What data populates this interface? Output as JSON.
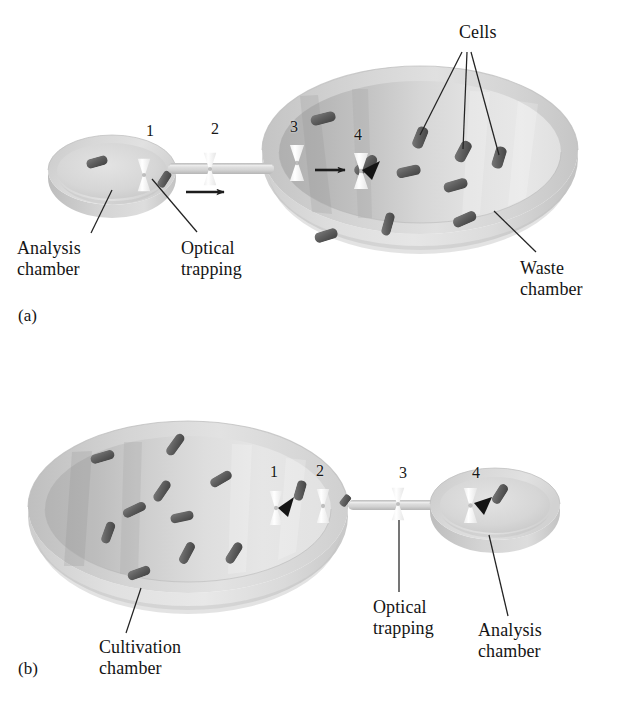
{
  "figure": {
    "background": "#ffffff",
    "ink": "#141414",
    "palette": {
      "bowl_rim_light": "#dcdcdc",
      "bowl_rim_mid": "#c8c8c8",
      "bowl_interior_dark": "#b6b6b6",
      "bowl_interior_light": "#e3e3e3",
      "dish_light": "#dadada",
      "dish_shadow": "#b9b9b9",
      "channel": "#cfcfcf",
      "cell": "#6a6a6a",
      "cell_dark": "#4c4c4c",
      "trap_white": "#fdfdfd",
      "leader": "#2a2a2a"
    }
  },
  "panels": [
    {
      "id": "a",
      "tag": "(a)",
      "tag_pos": {
        "x": 18,
        "y": 315
      },
      "description": "Cell transported by optical trapping from analysis chamber to waste chamber",
      "flow_direction": "left-to-right",
      "chambers": [
        {
          "name": "analysis-chamber",
          "role": "source",
          "size": "small",
          "label": "Analysis\nchamber"
        },
        {
          "name": "waste-chamber",
          "role": "destination",
          "size": "large",
          "label": "Waste\nchamber"
        }
      ],
      "trap_numbers": [
        {
          "n": "1",
          "x": 150,
          "y": 132
        },
        {
          "n": "2",
          "x": 215,
          "y": 130
        },
        {
          "n": "3",
          "x": 294,
          "y": 128
        },
        {
          "n": "4",
          "x": 358,
          "y": 136
        }
      ],
      "labels": [
        {
          "name": "analysis-chamber-label",
          "text": "Analysis\nchamber",
          "x": 17,
          "y": 246,
          "align": "left",
          "size": 18
        },
        {
          "name": "optical-trapping-label",
          "text": "Optical\ntrapping",
          "x": 181,
          "y": 246,
          "align": "left",
          "size": 18
        },
        {
          "name": "waste-chamber-label",
          "text": "Waste\nchamber",
          "x": 520,
          "y": 266,
          "align": "left",
          "size": 18
        },
        {
          "name": "cells-label",
          "text": "Cells",
          "x": 459,
          "y": 30,
          "align": "left",
          "size": 18
        }
      ]
    },
    {
      "id": "b",
      "tag": "(b)",
      "tag_pos": {
        "x": 18,
        "y": 668
      },
      "description": "Cell transported by optical trapping from cultivation chamber to analysis chamber",
      "flow_direction": "left-to-right",
      "chambers": [
        {
          "name": "cultivation-chamber",
          "role": "source",
          "size": "large",
          "label": "Cultivation\nchamber"
        },
        {
          "name": "analysis-chamber",
          "role": "destination",
          "size": "small",
          "label": "Analysis\nchamber"
        }
      ],
      "trap_numbers": [
        {
          "n": "1",
          "x": 274,
          "y": 473
        },
        {
          "n": "2",
          "x": 320,
          "y": 472
        },
        {
          "n": "3",
          "x": 403,
          "y": 474
        },
        {
          "n": "4",
          "x": 476,
          "y": 474
        }
      ],
      "labels": [
        {
          "name": "cultivation-chamber-label",
          "text": "Cultivation\nchamber",
          "x": 99,
          "y": 645,
          "align": "left",
          "size": 18
        },
        {
          "name": "optical-trapping-label",
          "text": "Optical\ntrapping",
          "x": 373,
          "y": 605,
          "align": "left",
          "size": 18
        },
        {
          "name": "analysis-chamber-label",
          "text": "Analysis\nchamber",
          "x": 478,
          "y": 628,
          "align": "left",
          "size": 18
        }
      ]
    }
  ]
}
